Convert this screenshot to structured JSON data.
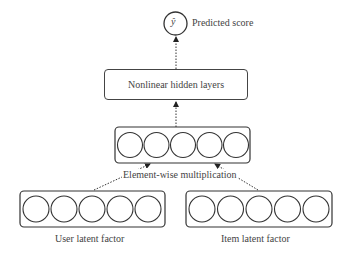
{
  "output": {
    "symbol": "ŷ",
    "label": "Predicted score"
  },
  "hidden": {
    "label": "Nonlinear hidden layers"
  },
  "merge": {
    "label": "Element-wise multiplication",
    "units": 5
  },
  "user": {
    "label": "User latent factor",
    "units": 5
  },
  "item": {
    "label": "Item latent factor",
    "units": 5
  }
}
